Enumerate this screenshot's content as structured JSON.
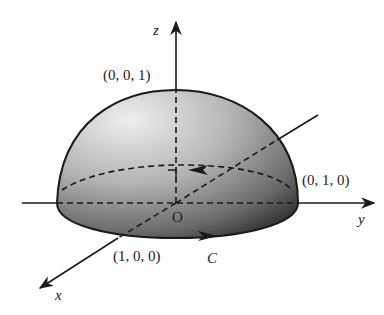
{
  "figure": {
    "axes": {
      "x_label": "x",
      "y_label": "y",
      "z_label": "z",
      "origin_label": "O"
    },
    "points": {
      "top": "(0, 0, 1)",
      "x_intercept": "(1, 0, 0)",
      "y_intercept": "(0, 1, 0)"
    },
    "curve_label": "C",
    "colors": {
      "surface_light": "#e6e6e6",
      "surface_dark": "#2a2a2a",
      "stroke": "#1a1a1a"
    }
  }
}
